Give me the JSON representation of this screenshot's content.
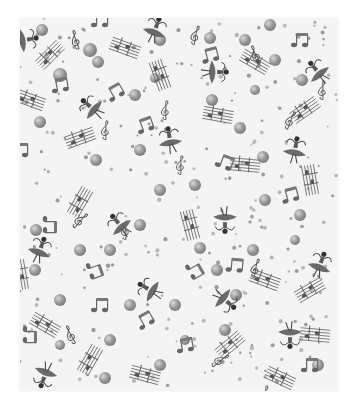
{
  "image": {
    "description": "Grayscale fabric swatch with a ballerina and music notes pattern",
    "background_color": "#ffffff",
    "fabric_color": "#f4f4f4",
    "motif_dark": "#555555",
    "motif_mid": "#8a8a8a",
    "motif_light": "#b5b5b5",
    "fabric_bounds": {
      "left": 20,
      "top": 18,
      "right": 338,
      "bottom": 391
    }
  },
  "motifs": {
    "ballerinas": [
      {
        "x": 25,
        "y": 40,
        "rot": 80
      },
      {
        "x": 155,
        "y": 30,
        "rot": 20
      },
      {
        "x": 92,
        "y": 108,
        "rot": -50
      },
      {
        "x": 215,
        "y": 72,
        "rot": 90
      },
      {
        "x": 170,
        "y": 140,
        "rot": -10
      },
      {
        "x": 318,
        "y": 72,
        "rot": -40
      },
      {
        "x": 295,
        "y": 150,
        "rot": 10
      },
      {
        "x": 40,
        "y": 250,
        "rot": 20
      },
      {
        "x": 120,
        "y": 225,
        "rot": -40
      },
      {
        "x": 150,
        "y": 290,
        "rot": -60
      },
      {
        "x": 225,
        "y": 220,
        "rot": 180
      },
      {
        "x": 225,
        "y": 300,
        "rot": 130
      },
      {
        "x": 320,
        "y": 265,
        "rot": 20
      },
      {
        "x": 290,
        "y": 335,
        "rot": 180
      },
      {
        "x": 45,
        "y": 375,
        "rot": 200
      }
    ],
    "eighth_notes": [
      {
        "x": 100,
        "y": 20,
        "rot": 0
      },
      {
        "x": 60,
        "y": 85,
        "rot": -10
      },
      {
        "x": 115,
        "y": 92,
        "rot": -30
      },
      {
        "x": 145,
        "y": 125,
        "rot": -20
      },
      {
        "x": 210,
        "y": 55,
        "rot": -15
      },
      {
        "x": 300,
        "y": 40,
        "rot": 0
      },
      {
        "x": 225,
        "y": 162,
        "rot": 20
      },
      {
        "x": 290,
        "y": 195,
        "rot": -15
      },
      {
        "x": 50,
        "y": 225,
        "rot": 90
      },
      {
        "x": 95,
        "y": 270,
        "rot": 70
      },
      {
        "x": 100,
        "y": 305,
        "rot": 0
      },
      {
        "x": 145,
        "y": 320,
        "rot": -30
      },
      {
        "x": 235,
        "y": 265,
        "rot": 5
      },
      {
        "x": 195,
        "y": 270,
        "rot": 60
      },
      {
        "x": 185,
        "y": 345,
        "rot": -10
      },
      {
        "x": 310,
        "y": 365,
        "rot": 0
      },
      {
        "x": 30,
        "y": 335,
        "rot": 90
      },
      {
        "x": 20,
        "y": 150,
        "rot": 0
      }
    ],
    "treble_clefs": [
      {
        "x": 75,
        "y": 40,
        "rot": -20
      },
      {
        "x": 105,
        "y": 130,
        "rot": 0
      },
      {
        "x": 195,
        "y": 35,
        "rot": 10
      },
      {
        "x": 255,
        "y": 55,
        "rot": -30
      },
      {
        "x": 165,
        "y": 110,
        "rot": 0
      },
      {
        "x": 290,
        "y": 120,
        "rot": 20
      },
      {
        "x": 180,
        "y": 165,
        "rot": 0
      },
      {
        "x": 322,
        "y": 90,
        "rot": 0
      },
      {
        "x": 80,
        "y": 220,
        "rot": 40
      },
      {
        "x": 70,
        "y": 335,
        "rot": -30
      },
      {
        "x": 125,
        "y": 230,
        "rot": 0
      },
      {
        "x": 255,
        "y": 268,
        "rot": 10
      },
      {
        "x": 220,
        "y": 360,
        "rot": 50
      },
      {
        "x": 265,
        "y": 395,
        "rot": 0
      }
    ],
    "staves": [
      {
        "x": 50,
        "y": 55,
        "rot": -45
      },
      {
        "x": 125,
        "y": 48,
        "rot": 20
      },
      {
        "x": 160,
        "y": 75,
        "rot": 70
      },
      {
        "x": 30,
        "y": 100,
        "rot": 20
      },
      {
        "x": 80,
        "y": 138,
        "rot": -20
      },
      {
        "x": 255,
        "y": 62,
        "rot": 30
      },
      {
        "x": 218,
        "y": 115,
        "rot": 10
      },
      {
        "x": 305,
        "y": 110,
        "rot": -35
      },
      {
        "x": 245,
        "y": 165,
        "rot": 5
      },
      {
        "x": 310,
        "y": 180,
        "rot": 80
      },
      {
        "x": 80,
        "y": 202,
        "rot": -60
      },
      {
        "x": 190,
        "y": 225,
        "rot": 75
      },
      {
        "x": 265,
        "y": 280,
        "rot": 20
      },
      {
        "x": 310,
        "y": 290,
        "rot": -30
      },
      {
        "x": 45,
        "y": 325,
        "rot": 30
      },
      {
        "x": 90,
        "y": 360,
        "rot": -60
      },
      {
        "x": 145,
        "y": 375,
        "rot": 15
      },
      {
        "x": 230,
        "y": 345,
        "rot": -40
      },
      {
        "x": 315,
        "y": 335,
        "rot": 5
      },
      {
        "x": 280,
        "y": 378,
        "rot": 25
      },
      {
        "x": 20,
        "y": 275,
        "rot": 80
      }
    ],
    "bubbles": [
      {
        "x": 42,
        "y": 30,
        "r": 6
      },
      {
        "x": 60,
        "y": 75,
        "r": 7
      },
      {
        "x": 90,
        "y": 50,
        "r": 7
      },
      {
        "x": 98,
        "y": 62,
        "r": 6
      },
      {
        "x": 40,
        "y": 122,
        "r": 6
      },
      {
        "x": 135,
        "y": 95,
        "r": 6
      },
      {
        "x": 160,
        "y": 40,
        "r": 6
      },
      {
        "x": 155,
        "y": 78,
        "r": 5
      },
      {
        "x": 96,
        "y": 160,
        "r": 6
      },
      {
        "x": 140,
        "y": 150,
        "r": 6
      },
      {
        "x": 160,
        "y": 190,
        "r": 6
      },
      {
        "x": 210,
        "y": 38,
        "r": 6
      },
      {
        "x": 245,
        "y": 40,
        "r": 6
      },
      {
        "x": 270,
        "y": 25,
        "r": 6
      },
      {
        "x": 275,
        "y": 60,
        "r": 6
      },
      {
        "x": 255,
        "y": 90,
        "r": 5
      },
      {
        "x": 302,
        "y": 80,
        "r": 6
      },
      {
        "x": 212,
        "y": 100,
        "r": 6
      },
      {
        "x": 240,
        "y": 128,
        "r": 6
      },
      {
        "x": 263,
        "y": 157,
        "r": 6
      },
      {
        "x": 195,
        "y": 185,
        "r": 6
      },
      {
        "x": 300,
        "y": 215,
        "r": 6
      },
      {
        "x": 36,
        "y": 230,
        "r": 6
      },
      {
        "x": 35,
        "y": 270,
        "r": 6
      },
      {
        "x": 60,
        "y": 300,
        "r": 6
      },
      {
        "x": 80,
        "y": 250,
        "r": 6
      },
      {
        "x": 110,
        "y": 250,
        "r": 6
      },
      {
        "x": 140,
        "y": 225,
        "r": 6
      },
      {
        "x": 130,
        "y": 305,
        "r": 6
      },
      {
        "x": 105,
        "y": 378,
        "r": 6
      },
      {
        "x": 200,
        "y": 248,
        "r": 6
      },
      {
        "x": 217,
        "y": 270,
        "r": 6
      },
      {
        "x": 236,
        "y": 295,
        "r": 6
      },
      {
        "x": 253,
        "y": 250,
        "r": 6
      },
      {
        "x": 265,
        "y": 200,
        "r": 6
      },
      {
        "x": 225,
        "y": 330,
        "r": 6
      },
      {
        "x": 175,
        "y": 305,
        "r": 6
      },
      {
        "x": 185,
        "y": 340,
        "r": 5
      },
      {
        "x": 160,
        "y": 365,
        "r": 6
      },
      {
        "x": 295,
        "y": 240,
        "r": 5
      },
      {
        "x": 318,
        "y": 365,
        "r": 6
      },
      {
        "x": 60,
        "y": 345,
        "r": 5
      },
      {
        "x": 110,
        "y": 340,
        "r": 6
      }
    ]
  }
}
